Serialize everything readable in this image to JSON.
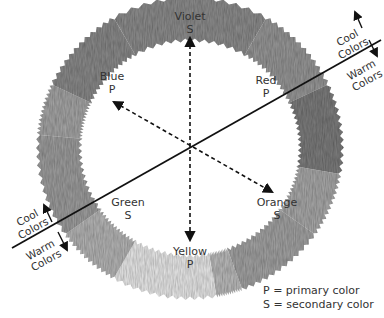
{
  "diagram": {
    "center": {
      "x": 190,
      "y": 148
    },
    "ring": {
      "outer_rx": 152,
      "outer_ry": 150,
      "inner_rx": 110,
      "inner_ry": 108
    },
    "segments": [
      {
        "name": "violet",
        "start": -120,
        "end": -60,
        "shade": "#8f8f8f"
      },
      {
        "name": "red-violet",
        "start": -60,
        "end": -25,
        "shade": "#9a9a9a"
      },
      {
        "name": "red",
        "start": -25,
        "end": 10,
        "shade": "#7f7f7f"
      },
      {
        "name": "red-orange",
        "start": 10,
        "end": 35,
        "shade": "#ababab"
      },
      {
        "name": "orange",
        "start": 35,
        "end": 70,
        "shade": "#a5a5a5"
      },
      {
        "name": "yellow-orange",
        "start": 70,
        "end": 80,
        "shade": "#bdbdbd"
      },
      {
        "name": "yellow",
        "start": 80,
        "end": 120,
        "shade": "#ececec"
      },
      {
        "name": "yellow-green",
        "start": 120,
        "end": 145,
        "shade": "#b8b8b8"
      },
      {
        "name": "green",
        "start": 145,
        "end": 185,
        "shade": "#a0a0a0"
      },
      {
        "name": "blue-green",
        "start": 185,
        "end": 205,
        "shade": "#a8a8a8"
      },
      {
        "name": "blue",
        "start": 205,
        "end": 240,
        "shade": "#8c8c8c"
      }
    ],
    "colors": [
      {
        "name": "Violet",
        "type": "S",
        "x": 190,
        "y": 20
      },
      {
        "name": "Blue",
        "type": "P",
        "x": 112,
        "y": 80
      },
      {
        "name": "Red",
        "type": "P",
        "x": 266,
        "y": 84
      },
      {
        "name": "Green",
        "type": "S",
        "x": 128,
        "y": 206
      },
      {
        "name": "Orange",
        "type": "S",
        "x": 277,
        "y": 206
      },
      {
        "name": "Yellow",
        "type": "P",
        "x": 190,
        "y": 255
      }
    ],
    "divider": {
      "x1": 12,
      "y1": 248,
      "x2": 381,
      "y2": 40,
      "upper_label": "Cool Colors",
      "lower_label": "Warm Colors",
      "upper_label_lines": [
        "Cool",
        "Colors"
      ],
      "lower_label_lines": [
        "Warm",
        "Colors"
      ]
    },
    "complement_arrows": [
      {
        "from": "Violet",
        "to": "Yellow"
      },
      {
        "from": "Blue",
        "to": "Orange"
      }
    ]
  },
  "legend": {
    "primary": "P = primary color",
    "secondary": "S = secondary color"
  }
}
